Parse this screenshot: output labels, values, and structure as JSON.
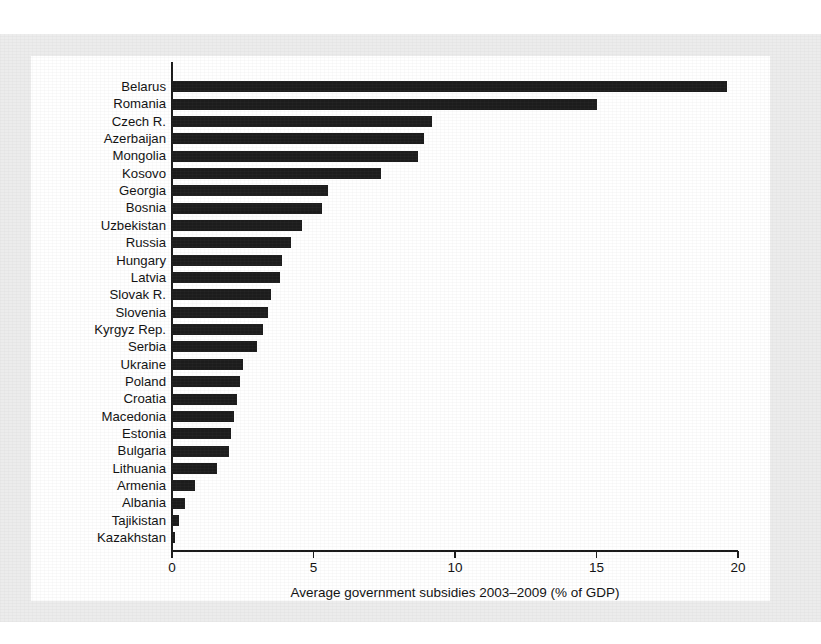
{
  "figure": {
    "background_color": "#ececec",
    "plot_background_color": "#ffffff",
    "bar_color": "#1c1c1c",
    "axis_color": "#1a1a1a"
  },
  "chart_data": {
    "type": "bar",
    "orientation": "horizontal",
    "title": "",
    "subtitle": "",
    "xlabel": "Average government subsidies 2003–2009 (% of GDP)",
    "ylabel": "",
    "xlim": [
      0,
      20.8
    ],
    "xticks": [
      0,
      5,
      10,
      15,
      20
    ],
    "xticklabels": [
      "0",
      "5",
      "10",
      "15",
      "20"
    ],
    "grid": false,
    "legend": null,
    "categories": [
      "Belarus",
      "Romania",
      "Czech R.",
      "Azerbaijan",
      "Mongolia",
      "Kosovo",
      "Georgia",
      "Bosnia",
      "Uzbekistan",
      "Russia",
      "Hungary",
      "Latvia",
      "Slovak R.",
      "Slovenia",
      "Kyrgyz Rep.",
      "Serbia",
      "Ukraine",
      "Poland",
      "Croatia",
      "Macedonia",
      "Estonia",
      "Bulgaria",
      "Lithuania",
      "Armenia",
      "Albania",
      "Tajikistan",
      "Kazakhstan"
    ],
    "values": [
      19.6,
      15.0,
      9.2,
      8.9,
      8.7,
      7.4,
      5.5,
      5.3,
      4.6,
      4.2,
      3.9,
      3.8,
      3.5,
      3.4,
      3.2,
      3.0,
      2.5,
      2.4,
      2.3,
      2.2,
      2.1,
      2.0,
      1.6,
      0.8,
      0.45,
      0.25,
      0.1
    ]
  }
}
